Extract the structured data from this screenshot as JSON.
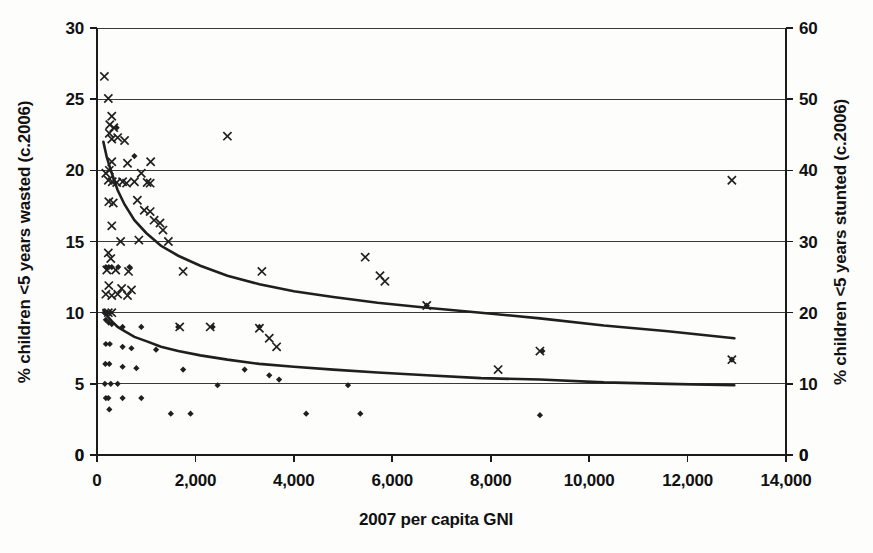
{
  "chart_data": {
    "type": "scatter",
    "title": "",
    "subtitle": "",
    "xlabel": "2007 per capita GNI",
    "ylabel_left": "% children <5 years wasted (c.2006)",
    "ylabel_right": "% children <5 years stunted (c.2006)",
    "xlim": [
      0,
      14000
    ],
    "ylim_left": [
      0,
      30
    ],
    "ylim_right": [
      0,
      60
    ],
    "grid": true,
    "legend": "none",
    "x_ticks": [
      "0",
      "2,000",
      "4,000",
      "6,000",
      "8,000",
      "10,000",
      "12,000",
      "14,000"
    ],
    "x_tick_values": [
      0,
      2000,
      4000,
      6000,
      8000,
      10000,
      12000,
      14000
    ],
    "y_ticks_left": [
      "0",
      "5",
      "10",
      "15",
      "20",
      "25",
      "30"
    ],
    "y_tick_values_left": [
      0,
      5,
      10,
      15,
      20,
      25,
      30
    ],
    "y_ticks_right": [
      "0",
      "10",
      "20",
      "30",
      "40",
      "50",
      "60"
    ],
    "y_tick_values_right": [
      0,
      10,
      20,
      30,
      40,
      50,
      60
    ],
    "corner_label_bottom_left": "0",
    "corner_label_bottom_right": "0",
    "series": [
      {
        "name": "stunted",
        "marker": "x",
        "axis": "right",
        "points": [
          [
            150,
            53.2
          ],
          [
            230,
            50.1
          ],
          [
            300,
            47.6
          ],
          [
            260,
            46.4
          ],
          [
            340,
            46.0
          ],
          [
            250,
            45.2
          ],
          [
            300,
            44.4
          ],
          [
            420,
            44.6
          ],
          [
            560,
            44.2
          ],
          [
            2650,
            44.8
          ],
          [
            300,
            41.2
          ],
          [
            620,
            41.0
          ],
          [
            1090,
            41.2
          ],
          [
            250,
            40.0
          ],
          [
            12900,
            38.6
          ],
          [
            180,
            39.6
          ],
          [
            230,
            38.6
          ],
          [
            310,
            38.4
          ],
          [
            400,
            38.3
          ],
          [
            520,
            38.4
          ],
          [
            600,
            38.2
          ],
          [
            760,
            38.4
          ],
          [
            900,
            39.6
          ],
          [
            1020,
            38.3
          ],
          [
            1080,
            38.2
          ],
          [
            240,
            35.6
          ],
          [
            330,
            35.4
          ],
          [
            820,
            35.8
          ],
          [
            960,
            34.4
          ],
          [
            1080,
            34.2
          ],
          [
            1160,
            33.0
          ],
          [
            1280,
            32.6
          ],
          [
            300,
            32.2
          ],
          [
            1340,
            31.6
          ],
          [
            480,
            30.0
          ],
          [
            850,
            30.2
          ],
          [
            1450,
            30.0
          ],
          [
            230,
            28.4
          ],
          [
            280,
            27.6
          ],
          [
            5450,
            27.8
          ],
          [
            200,
            26.0
          ],
          [
            380,
            26.0
          ],
          [
            640,
            25.8
          ],
          [
            1750,
            25.8
          ],
          [
            3350,
            25.8
          ],
          [
            5750,
            25.2
          ],
          [
            5850,
            24.4
          ],
          [
            6700,
            21.0
          ],
          [
            240,
            23.8
          ],
          [
            500,
            23.4
          ],
          [
            700,
            23.2
          ],
          [
            180,
            22.6
          ],
          [
            300,
            22.4
          ],
          [
            420,
            22.6
          ],
          [
            620,
            22.4
          ],
          [
            1680,
            18.0
          ],
          [
            2300,
            18.0
          ],
          [
            3300,
            17.8
          ],
          [
            3500,
            16.4
          ],
          [
            3650,
            15.2
          ],
          [
            230,
            20.0
          ],
          [
            300,
            20.0
          ],
          [
            9000,
            14.6
          ],
          [
            8150,
            12.0
          ],
          [
            12900,
            13.4
          ]
        ]
      },
      {
        "name": "wasted",
        "marker": "diamond",
        "axis": "left",
        "points": [
          [
            400,
            23.0
          ],
          [
            760,
            21.0
          ],
          [
            180,
            13.2
          ],
          [
            240,
            13.2
          ],
          [
            300,
            13.2
          ],
          [
            430,
            13.2
          ],
          [
            660,
            13.2
          ],
          [
            150,
            10.0
          ],
          [
            210,
            10.0
          ],
          [
            260,
            10.0
          ],
          [
            180,
            9.5
          ],
          [
            240,
            9.3
          ],
          [
            300,
            9.2
          ],
          [
            520,
            9.0
          ],
          [
            900,
            9.0
          ],
          [
            1650,
            9.0
          ],
          [
            2350,
            9.0
          ],
          [
            3300,
            9.0
          ],
          [
            180,
            7.8
          ],
          [
            260,
            7.8
          ],
          [
            520,
            7.6
          ],
          [
            700,
            7.5
          ],
          [
            1200,
            7.4
          ],
          [
            170,
            6.4
          ],
          [
            250,
            6.4
          ],
          [
            520,
            6.2
          ],
          [
            800,
            6.1
          ],
          [
            1750,
            6.0
          ],
          [
            3000,
            6.0
          ],
          [
            3500,
            5.6
          ],
          [
            3700,
            5.3
          ],
          [
            160,
            5.0
          ],
          [
            280,
            5.0
          ],
          [
            420,
            5.0
          ],
          [
            2450,
            4.9
          ],
          [
            5100,
            4.9
          ],
          [
            180,
            4.0
          ],
          [
            230,
            4.0
          ],
          [
            520,
            4.0
          ],
          [
            900,
            4.0
          ],
          [
            250,
            3.2
          ],
          [
            1500,
            2.9
          ],
          [
            1900,
            2.9
          ],
          [
            9000,
            2.8
          ],
          [
            4250,
            2.9
          ],
          [
            5350,
            2.9
          ],
          [
            12900,
            6.7
          ],
          [
            9050,
            7.3
          ],
          [
            6700,
            10.5
          ]
        ]
      }
    ],
    "trend_curves": [
      {
        "name": "stunted-trend",
        "axis": "right",
        "points": [
          [
            130,
            44.0
          ],
          [
            200,
            41.8
          ],
          [
            300,
            39.6
          ],
          [
            420,
            37.2
          ],
          [
            560,
            35.2
          ],
          [
            760,
            33.0
          ],
          [
            1000,
            31.2
          ],
          [
            1300,
            29.4
          ],
          [
            1650,
            28.0
          ],
          [
            2100,
            26.6
          ],
          [
            2650,
            25.2
          ],
          [
            3300,
            24.0
          ],
          [
            4000,
            23.0
          ],
          [
            4800,
            22.2
          ],
          [
            5700,
            21.4
          ],
          [
            6700,
            20.7
          ],
          [
            7800,
            20.0
          ],
          [
            9000,
            19.2
          ],
          [
            10300,
            18.2
          ],
          [
            11600,
            17.4
          ],
          [
            12950,
            16.4
          ]
        ]
      },
      {
        "name": "wasted-trend",
        "axis": "left",
        "points": [
          [
            130,
            10.2
          ],
          [
            200,
            9.8
          ],
          [
            300,
            9.4
          ],
          [
            420,
            9.0
          ],
          [
            560,
            8.7
          ],
          [
            760,
            8.3
          ],
          [
            1000,
            8.0
          ],
          [
            1300,
            7.6
          ],
          [
            1650,
            7.3
          ],
          [
            2100,
            7.0
          ],
          [
            2650,
            6.7
          ],
          [
            3300,
            6.4
          ],
          [
            4000,
            6.2
          ],
          [
            4800,
            6.0
          ],
          [
            5700,
            5.8
          ],
          [
            6700,
            5.6
          ],
          [
            7800,
            5.4
          ],
          [
            9000,
            5.3
          ],
          [
            10300,
            5.1
          ],
          [
            11600,
            5.0
          ],
          [
            12950,
            4.9
          ]
        ]
      }
    ]
  }
}
